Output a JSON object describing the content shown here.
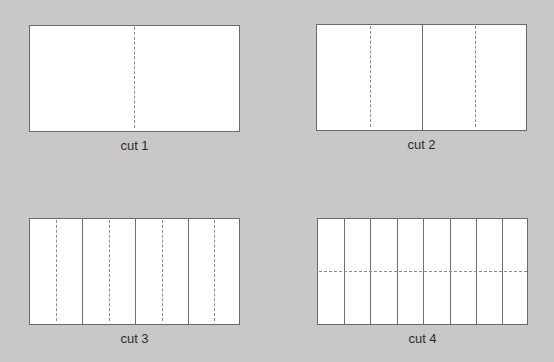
{
  "diagram": {
    "background_color": "#c8c8c8",
    "panel_color": "#ffffff",
    "line_color": "#707070",
    "panels": [
      {
        "caption": "cut 1",
        "solid_vertical_cuts": 0,
        "dashed_vertical_folds": 1,
        "dashed_horizontal_folds": 0,
        "strips": 1
      },
      {
        "caption": "cut 2",
        "solid_vertical_cuts": 1,
        "dashed_vertical_folds": 2,
        "dashed_horizontal_folds": 0,
        "strips": 2
      },
      {
        "caption": "cut 3",
        "solid_vertical_cuts": 3,
        "dashed_vertical_folds": 4,
        "dashed_horizontal_folds": 0,
        "strips": 4
      },
      {
        "caption": "cut 4",
        "solid_vertical_cuts": 7,
        "dashed_vertical_folds": 0,
        "dashed_horizontal_folds": 1,
        "strips": 8
      }
    ]
  }
}
